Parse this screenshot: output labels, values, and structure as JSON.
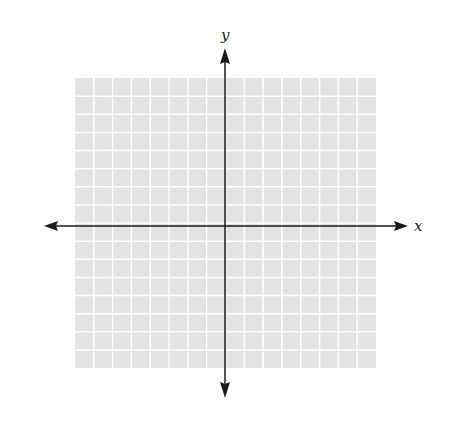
{
  "diagram": {
    "type": "coordinate-plane",
    "x_label": "x",
    "y_label": "y",
    "grid": {
      "columns": 16,
      "rows": 16,
      "fill": "#e3e3e3",
      "line_color": "#ffffff"
    },
    "axis_color": "#1a1a1a"
  }
}
